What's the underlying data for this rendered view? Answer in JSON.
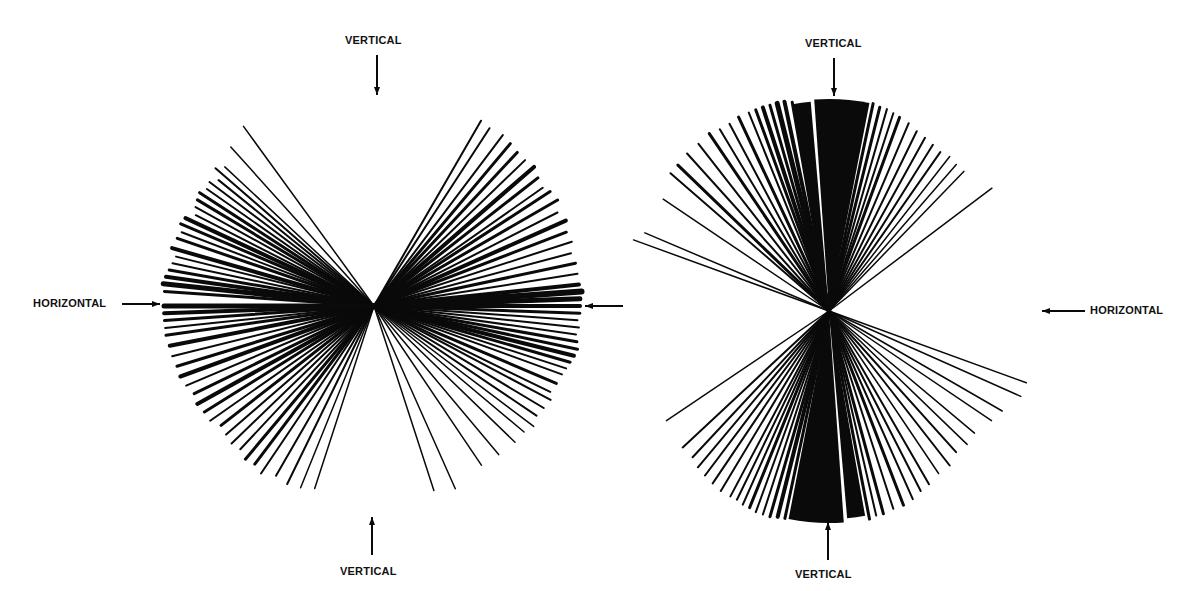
{
  "colors": {
    "ink": "#0a0a0a",
    "background": "#ffffff"
  },
  "left_diagram": {
    "center": [
      374,
      306
    ],
    "labels": {
      "top": "VERTICAL",
      "bottom": "VERTICAL",
      "left": "HORIZONTAL"
    },
    "arrows": {
      "top": {
        "x": 377,
        "y1": 55,
        "y2": 95,
        "dir": "down"
      },
      "bottom": {
        "x": 372,
        "y1": 555,
        "y2": 517,
        "dir": "up"
      },
      "left": {
        "y": 304,
        "x1": 122,
        "x2": 160,
        "dir": "right"
      },
      "right": {
        "y": 306,
        "x1": 623,
        "x2": 585,
        "dir": "left"
      }
    },
    "rays": [
      [
        -176,
        210,
        3
      ],
      [
        -174,
        212,
        5
      ],
      [
        -172,
        210,
        4
      ],
      [
        -170,
        208,
        3
      ],
      [
        -168,
        206,
        2
      ],
      [
        -166,
        204,
        2
      ],
      [
        -164,
        210,
        4
      ],
      [
        -161,
        208,
        3
      ],
      [
        -159,
        206,
        2
      ],
      [
        -157,
        210,
        3
      ],
      [
        -155,
        208,
        4
      ],
      [
        -153,
        200,
        2
      ],
      [
        -151,
        204,
        2
      ],
      [
        -149,
        206,
        3
      ],
      [
        -147,
        208,
        3
      ],
      [
        -145,
        204,
        2
      ],
      [
        -143,
        206,
        2
      ],
      [
        -141,
        200,
        2
      ],
      [
        -139,
        210,
        2
      ],
      [
        -137,
        204,
        1.5
      ],
      [
        -132,
        214,
        1.5
      ],
      [
        -126,
        222,
        1.5
      ],
      [
        -60,
        214,
        2
      ],
      [
        -57,
        212,
        2
      ],
      [
        -53,
        214,
        2
      ],
      [
        -50,
        212,
        3
      ],
      [
        -47,
        210,
        3
      ],
      [
        -44,
        210,
        2
      ],
      [
        -41,
        212,
        4
      ],
      [
        -38,
        208,
        3
      ],
      [
        -35,
        206,
        2
      ],
      [
        -33,
        210,
        3
      ],
      [
        -30,
        212,
        3
      ],
      [
        -27,
        206,
        2
      ],
      [
        -24,
        210,
        4
      ],
      [
        -21,
        206,
        3
      ],
      [
        -18,
        208,
        2
      ],
      [
        -15,
        204,
        2
      ],
      [
        -12,
        206,
        3
      ],
      [
        -9,
        206,
        2
      ],
      [
        -6,
        206,
        4
      ],
      [
        -4,
        208,
        6
      ],
      [
        -2,
        206,
        5
      ],
      [
        0,
        206,
        4
      ],
      [
        2,
        206,
        3
      ],
      [
        4,
        204,
        2
      ],
      [
        6,
        206,
        2
      ],
      [
        8,
        204,
        2
      ],
      [
        10,
        206,
        3
      ],
      [
        12,
        208,
        3
      ],
      [
        14,
        206,
        4
      ],
      [
        16,
        204,
        3
      ],
      [
        18,
        202,
        2
      ],
      [
        20,
        200,
        2
      ],
      [
        23,
        198,
        3
      ],
      [
        26,
        196,
        2
      ],
      [
        28,
        200,
        2
      ],
      [
        31,
        198,
        2
      ],
      [
        34,
        196,
        2
      ],
      [
        37,
        200,
        1.5
      ],
      [
        40,
        196,
        1.5
      ],
      [
        44,
        196,
        1.5
      ],
      [
        50,
        194,
        1.5
      ],
      [
        56,
        192,
        1.5
      ],
      [
        66,
        200,
        1.5
      ],
      [
        72,
        194,
        1.5
      ],
      [
        108,
        192,
        1.5
      ],
      [
        112,
        196,
        1.5
      ],
      [
        116,
        198,
        2
      ],
      [
        120,
        196,
        2
      ],
      [
        124,
        202,
        2
      ],
      [
        127,
        198,
        3
      ],
      [
        130,
        200,
        3
      ],
      [
        133,
        196,
        2
      ],
      [
        136,
        198,
        2
      ],
      [
        139,
        196,
        2
      ],
      [
        142,
        194,
        3
      ],
      [
        145,
        200,
        2
      ],
      [
        148,
        200,
        3
      ],
      [
        151,
        202,
        4
      ],
      [
        154,
        200,
        3
      ],
      [
        157,
        204,
        2
      ],
      [
        160,
        206,
        4
      ],
      [
        163,
        206,
        3
      ],
      [
        166,
        208,
        2
      ],
      [
        169,
        208,
        4
      ],
      [
        172,
        210,
        3
      ],
      [
        174,
        210,
        2
      ],
      [
        176,
        210,
        3
      ],
      [
        178,
        210,
        4
      ],
      [
        180,
        210,
        5
      ]
    ]
  },
  "right_diagram": {
    "center": [
      829,
      311
    ],
    "labels": {
      "top": "VERTICAL",
      "bottom": "VERTICAL",
      "right": "HORIZONTAL"
    },
    "arrows": {
      "top": {
        "x": 834,
        "y1": 58,
        "y2": 96,
        "dir": "down"
      },
      "bottom": {
        "x": 828,
        "y1": 560,
        "y2": 522,
        "dir": "up"
      },
      "right": {
        "y": 311,
        "x1": 1085,
        "x2": 1042,
        "dir": "left"
      }
    },
    "wedges": [
      {
        "from": -94,
        "to": -79,
        "r": 212
      },
      {
        "from": -100,
        "to": -95,
        "r": 210
      },
      {
        "from": 86,
        "to": 101,
        "r": 212
      },
      {
        "from": 80,
        "to": 85,
        "r": 208
      }
    ],
    "rays": [
      [
        -160,
        208,
        1.5
      ],
      [
        -157,
        200,
        1.5
      ],
      [
        -146,
        200,
        1.5
      ],
      [
        -139,
        210,
        2
      ],
      [
        -136,
        210,
        3
      ],
      [
        -132,
        212,
        2
      ],
      [
        -128,
        212,
        2
      ],
      [
        -124,
        214,
        3
      ],
      [
        -121,
        212,
        2
      ],
      [
        -118,
        212,
        2
      ],
      [
        -115,
        214,
        3
      ],
      [
        -112,
        214,
        2
      ],
      [
        -110,
        214,
        3
      ],
      [
        -108,
        214,
        4
      ],
      [
        -106,
        214,
        3
      ],
      [
        -104,
        214,
        5
      ],
      [
        -102,
        214,
        4
      ],
      [
        -100,
        212,
        3
      ],
      [
        -78,
        212,
        3
      ],
      [
        -76,
        210,
        3
      ],
      [
        -74,
        210,
        2
      ],
      [
        -72,
        208,
        2
      ],
      [
        -70,
        206,
        3
      ],
      [
        -67,
        204,
        2
      ],
      [
        -64,
        200,
        2
      ],
      [
        -61,
        198,
        2
      ],
      [
        -58,
        196,
        2
      ],
      [
        -55,
        194,
        2
      ],
      [
        -52,
        196,
        1.5
      ],
      [
        -49,
        194,
        1.5
      ],
      [
        -46,
        194,
        1.5
      ],
      [
        -37,
        204,
        1.5
      ],
      [
        20,
        210,
        1.5
      ],
      [
        24,
        210,
        1.5
      ],
      [
        30,
        200,
        1.5
      ],
      [
        34,
        196,
        1.5
      ],
      [
        40,
        190,
        1.5
      ],
      [
        44,
        192,
        1.5
      ],
      [
        48,
        190,
        2
      ],
      [
        52,
        196,
        2
      ],
      [
        56,
        196,
        1.5
      ],
      [
        60,
        200,
        2
      ],
      [
        63,
        202,
        2
      ],
      [
        66,
        206,
        2
      ],
      [
        69,
        208,
        3
      ],
      [
        72,
        208,
        2
      ],
      [
        75,
        210,
        3
      ],
      [
        77,
        210,
        2
      ],
      [
        79,
        212,
        3
      ],
      [
        102,
        212,
        3
      ],
      [
        104,
        212,
        4
      ],
      [
        106,
        214,
        3
      ],
      [
        108,
        214,
        2
      ],
      [
        110,
        214,
        2
      ],
      [
        112,
        212,
        3
      ],
      [
        114,
        212,
        2
      ],
      [
        116,
        210,
        2
      ],
      [
        118,
        210,
        2
      ],
      [
        121,
        210,
        2
      ],
      [
        124,
        208,
        2
      ],
      [
        127,
        206,
        2
      ],
      [
        130,
        204,
        2
      ],
      [
        133,
        200,
        2
      ],
      [
        137,
        200,
        2
      ],
      [
        146,
        196,
        1.5
      ]
    ]
  }
}
